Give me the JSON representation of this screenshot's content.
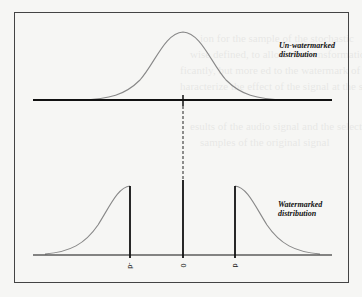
{
  "diagram": {
    "top_panel": {
      "label_line1": "Un-watermarked",
      "label_line2": "distribution",
      "curve": "gaussian",
      "center_tick": "0"
    },
    "bottom_panel": {
      "label_line1": "Watermarked",
      "label_line2": "distribution",
      "tick_labels": [
        "-d",
        "0",
        "d"
      ]
    },
    "colors": {
      "curve": "#888888",
      "axis": "#111111",
      "frame": "#444444",
      "background": "#f6f6f4"
    }
  }
}
